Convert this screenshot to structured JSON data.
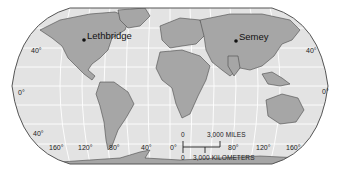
{
  "map": {
    "projection": "Robinson-style world map",
    "colors": {
      "ocean": "#e3e3e3",
      "land": "#a6a6a6",
      "border": "#4a4a4a",
      "grid": "#ffffff",
      "frame": "#555555"
    },
    "cities": [
      {
        "name": "Lethbridge"
      },
      {
        "name": "Semey"
      }
    ],
    "latitude_labels": {
      "left": [
        "40°",
        "0°",
        "40°"
      ],
      "right": [
        "40°",
        "0°"
      ]
    },
    "longitude_labels": [
      "160°",
      "120°",
      "80°",
      "40°",
      "0°",
      "80°",
      "120°",
      "160°"
    ],
    "scale_bar": {
      "miles_start": "0",
      "miles_label": "3,000 MILES",
      "km_start": "0",
      "km_label": "3,000 KILOMETERS"
    }
  }
}
